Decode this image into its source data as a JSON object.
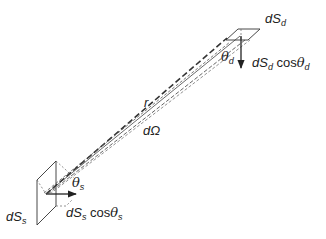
{
  "diagram": {
    "labels": {
      "detector_area": {
        "main": "dS",
        "sub": "d"
      },
      "detector_projected": {
        "main": "dS",
        "sub": "d",
        "suffix": "cos",
        "angle": "θ",
        "angle_sub": "d"
      },
      "detector_angle": {
        "main": "θ",
        "sub": "d"
      },
      "distance": "r",
      "solid_angle": "dΩ",
      "source_angle": {
        "main": "θ",
        "sub": "s"
      },
      "source_area": {
        "main": "dS",
        "sub": "s"
      },
      "source_projected": {
        "main": "dS",
        "sub": "s",
        "suffix": "cos",
        "angle": "θ",
        "angle_sub": "s"
      }
    },
    "colors": {
      "stroke": "#222222",
      "dashed": "#444444",
      "background": "#ffffff"
    }
  }
}
